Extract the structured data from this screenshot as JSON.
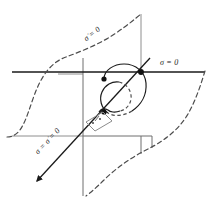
{
  "figure": {
    "title": "",
    "labels": {
      "sigma_zero": "σ = 0",
      "sigma_dot_zero": "σ̇ = 0",
      "both_zero": "σ = σ̇ = 0"
    },
    "colors": {
      "stroke_dark": "#1a1a1a",
      "stroke_gray": "#808080",
      "dashed": "#4d4d4d",
      "inset_box": "#8c8c8c",
      "background": "#ffffff"
    },
    "markers": {
      "dot_count": 3,
      "arrowhead_count": 1
    },
    "elements": {
      "horizontal_axis": "sigma-zero-axis",
      "vertical_plane": "sigma-dot-plane",
      "diagonal_axis": "sliding-manifold-axis",
      "trajectory": "spiral-trajectory",
      "inset": "origin-zoom-box"
    }
  }
}
